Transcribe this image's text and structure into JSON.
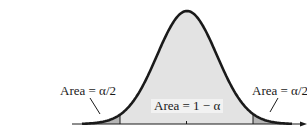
{
  "diagram": {
    "type": "normal-distribution-two-tailed",
    "labels": {
      "left_tail": "Area = α/2",
      "center": "Area = 1 − α",
      "right_tail": "Area = α/2"
    },
    "colors": {
      "curve": "#1a1a1a",
      "center_fill": "#e3e3e3",
      "tail_fill": "#b5b5b5",
      "axis": "#1a1a1a",
      "background": "#ffffff"
    }
  }
}
